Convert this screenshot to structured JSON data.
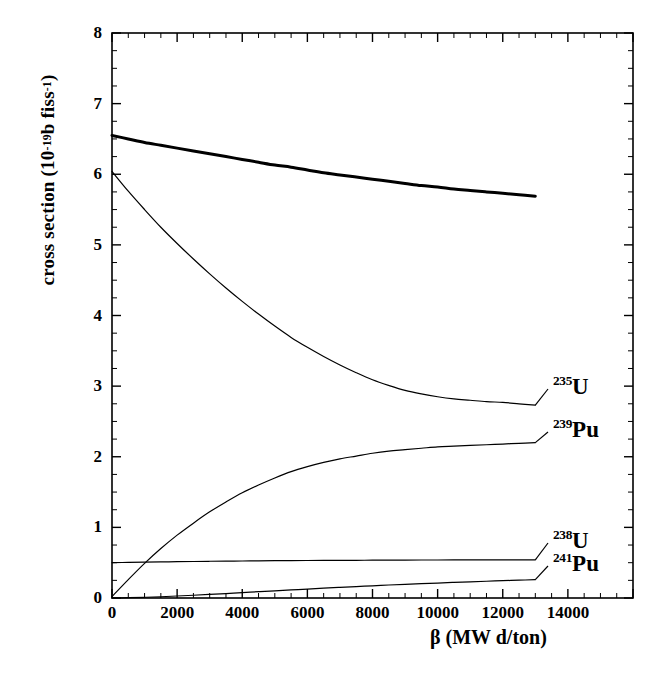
{
  "chart_data": {
    "type": "line",
    "title": "",
    "xlabel": "β (MW d/ton)",
    "ylabel": "cross section (10⁻¹⁹ b fiss⁻¹)",
    "xlabel_parts": {
      "symbol": "β",
      "unit": "(MW d/ton)"
    },
    "ylabel_parts": {
      "lead": "cross section (10",
      "exp1": "-19",
      "mid": "b fiss",
      "exp2": "-1",
      "tail": ")"
    },
    "xlim": [
      0,
      16000
    ],
    "ylim": [
      0,
      8
    ],
    "xticks": [
      0,
      2000,
      4000,
      6000,
      8000,
      10000,
      12000,
      14000
    ],
    "xtick_labels": [
      "0",
      "2000",
      "4000",
      "6000",
      "8000",
      "10000",
      "12000",
      "14000"
    ],
    "x_minor_step": 500,
    "yticks": [
      0,
      1,
      2,
      3,
      4,
      5,
      6,
      7,
      8
    ],
    "ytick_labels": [
      "0",
      "1",
      "2",
      "3",
      "4",
      "5",
      "6",
      "7",
      "8"
    ],
    "y_minor_step": 0.25,
    "grid": false,
    "legend_position": "inline-right-annotations",
    "x": [
      0,
      500,
      1000,
      1500,
      2000,
      2500,
      3000,
      3500,
      4000,
      4500,
      5000,
      5500,
      6000,
      6500,
      7000,
      7500,
      8000,
      8500,
      9000,
      9500,
      10000,
      10500,
      11000,
      11500,
      12000,
      12500,
      13000
    ],
    "series": [
      {
        "name": "total",
        "label": "",
        "linewidth": "thick",
        "values": [
          6.55,
          6.5,
          6.45,
          6.41,
          6.37,
          6.33,
          6.29,
          6.25,
          6.21,
          6.17,
          6.13,
          6.1,
          6.06,
          6.02,
          5.99,
          5.96,
          5.93,
          5.9,
          5.87,
          5.84,
          5.82,
          5.79,
          5.77,
          5.75,
          5.73,
          5.71,
          5.69
        ]
      },
      {
        "name": "U235",
        "label": "235U",
        "label_mass": "235",
        "label_element": "U",
        "linewidth": "thin",
        "values": [
          6.04,
          5.76,
          5.5,
          5.25,
          5.02,
          4.8,
          4.59,
          4.39,
          4.2,
          4.02,
          3.85,
          3.69,
          3.55,
          3.42,
          3.3,
          3.19,
          3.09,
          3.01,
          2.94,
          2.89,
          2.85,
          2.82,
          2.8,
          2.78,
          2.77,
          2.75,
          2.73
        ]
      },
      {
        "name": "Pu239",
        "label": "239Pu",
        "label_mass": "239",
        "label_element": "Pu",
        "linewidth": "thin",
        "values": [
          0.02,
          0.26,
          0.49,
          0.7,
          0.89,
          1.06,
          1.22,
          1.36,
          1.49,
          1.6,
          1.7,
          1.79,
          1.86,
          1.92,
          1.97,
          2.01,
          2.05,
          2.08,
          2.1,
          2.12,
          2.14,
          2.15,
          2.16,
          2.17,
          2.18,
          2.19,
          2.2
        ]
      },
      {
        "name": "U238",
        "label": "238U",
        "label_mass": "238",
        "label_element": "U",
        "linewidth": "thin",
        "values": [
          0.5,
          0.504,
          0.508,
          0.511,
          0.514,
          0.517,
          0.52,
          0.522,
          0.524,
          0.526,
          0.528,
          0.53,
          0.531,
          0.532,
          0.533,
          0.534,
          0.535,
          0.536,
          0.537,
          0.538,
          0.538,
          0.539,
          0.539,
          0.54,
          0.54,
          0.54,
          0.541
        ]
      },
      {
        "name": "Pu241",
        "label": "241Pu",
        "label_mass": "241",
        "label_element": "Pu",
        "linewidth": "thin",
        "values": [
          0.0,
          0.004,
          0.01,
          0.018,
          0.028,
          0.039,
          0.051,
          0.063,
          0.076,
          0.089,
          0.102,
          0.114,
          0.127,
          0.139,
          0.151,
          0.162,
          0.173,
          0.184,
          0.194,
          0.203,
          0.212,
          0.221,
          0.229,
          0.237,
          0.245,
          0.252,
          0.259
        ]
      }
    ],
    "annotations": [
      {
        "name": "U235",
        "mass": "235",
        "element": "U",
        "x_px": 553,
        "y_px": 375
      },
      {
        "name": "Pu239",
        "mass": "239",
        "element": "Pu",
        "x_px": 553,
        "y_px": 418
      },
      {
        "name": "U238",
        "mass": "238",
        "element": "U",
        "x_px": 553,
        "y_px": 529
      },
      {
        "name": "Pu241",
        "mass": "241",
        "element": "Pu",
        "x_px": 553,
        "y_px": 552
      }
    ]
  }
}
